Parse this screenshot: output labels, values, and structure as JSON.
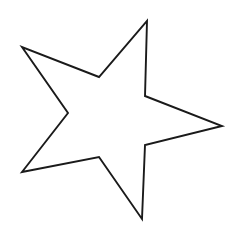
{
  "figure": {
    "shape_name": "star-polygon",
    "point_count": 5,
    "vertex_count": 10
  },
  "canvas": {
    "width": 234,
    "height": 232,
    "background_color": "#ffffff"
  },
  "style": {
    "stroke_color": "#1a1a1a",
    "fill": "none",
    "fill_label": "none",
    "stroke_width": 1.9,
    "line_join": "miter",
    "line_cap": "round"
  },
  "geometry": {
    "points_path": "147,21 145,96 222,126 145,145 142,219 99,157 22,172 68,113 22,47 99,77",
    "vertices": [
      {
        "name": "top-point",
        "kind": "outer",
        "x": 147,
        "y": 21
      },
      {
        "name": "inner-top-right",
        "kind": "inner",
        "x": 145,
        "y": 96
      },
      {
        "name": "right-point",
        "kind": "outer",
        "x": 222,
        "y": 126
      },
      {
        "name": "inner-bottom-right",
        "kind": "inner",
        "x": 145,
        "y": 145
      },
      {
        "name": "bottom-point",
        "kind": "outer",
        "x": 142,
        "y": 219
      },
      {
        "name": "inner-bottom",
        "kind": "inner",
        "x": 99,
        "y": 157
      },
      {
        "name": "bottom-left-point",
        "kind": "outer",
        "x": 22,
        "y": 172
      },
      {
        "name": "inner-left",
        "kind": "inner",
        "x": 68,
        "y": 113
      },
      {
        "name": "left-point",
        "kind": "outer",
        "x": 22,
        "y": 47
      },
      {
        "name": "inner-top-left",
        "kind": "inner",
        "x": 99,
        "y": 77
      }
    ],
    "bounding_box": {
      "x": 22,
      "y": 21,
      "width": 200,
      "height": 198
    }
  }
}
